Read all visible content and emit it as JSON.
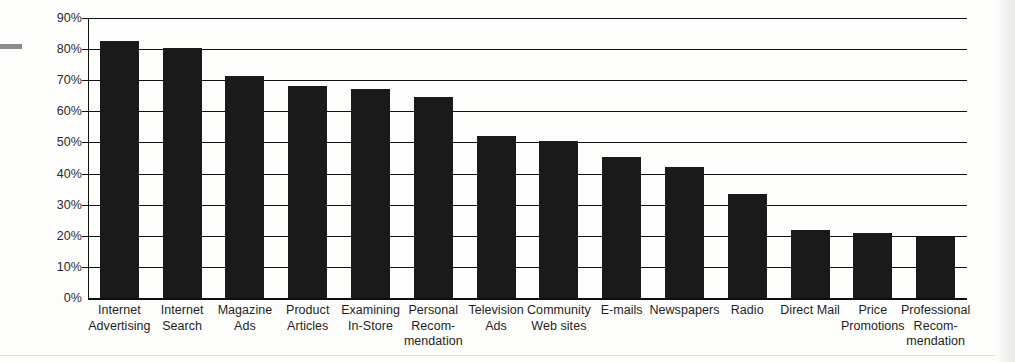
{
  "chart_data": {
    "type": "bar",
    "title": "",
    "subtitle": "",
    "xlabel": "",
    "ylabel": "",
    "ylim": [
      0,
      90
    ],
    "ytick_values": [
      0,
      10,
      20,
      30,
      40,
      50,
      60,
      70,
      80,
      90
    ],
    "ytick_labels": [
      "0%",
      "10%",
      "20%",
      "30%",
      "40%",
      "50%",
      "60%",
      "70%",
      "80%",
      "90%"
    ],
    "grid": true,
    "legend": false,
    "legend_position": "none",
    "bar_color": "#1a1a1a",
    "categories": [
      "Internet Advertising",
      "Internet Search",
      "Magazine Ads",
      "Product Articles",
      "Examining In-Store",
      "Personal Recommendation",
      "Television Ads",
      "Community Web sites",
      "E-mails",
      "Newspapers",
      "Radio",
      "Direct Mail",
      "Price Promotions",
      "Professional Recommendation"
    ],
    "category_label_lines": [
      [
        "Internet",
        "Advertising"
      ],
      [
        "Internet",
        "Search"
      ],
      [
        "Magazine",
        "Ads"
      ],
      [
        "Product",
        "Articles"
      ],
      [
        "Examining",
        "In-Store"
      ],
      [
        "Personal",
        "Recom-",
        "mendation"
      ],
      [
        "Television",
        "Ads"
      ],
      [
        "Community",
        "Web sites"
      ],
      [
        "E-mails"
      ],
      [
        "Newspapers"
      ],
      [
        "Radio"
      ],
      [
        "Direct Mail"
      ],
      [
        "Price",
        "Promotions"
      ],
      [
        "Professional",
        "Recom-",
        "mendation"
      ]
    ],
    "values": [
      82.5,
      80.3,
      71.3,
      68.0,
      67.2,
      64.5,
      52.0,
      50.6,
      45.2,
      42.0,
      33.5,
      22.0,
      21.0,
      19.7
    ]
  }
}
